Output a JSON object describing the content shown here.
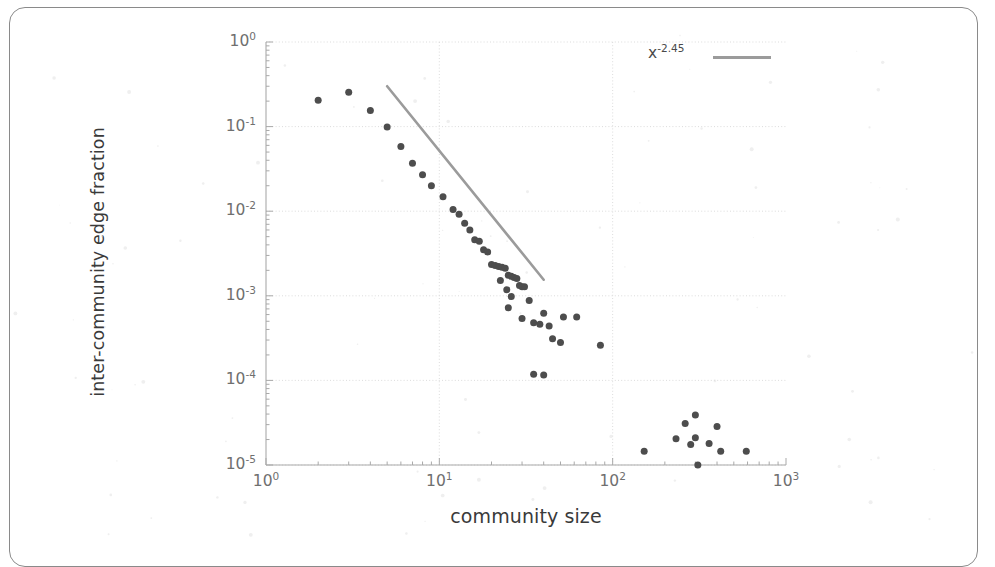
{
  "figure": {
    "kind": "scatter-plot-scanned-page",
    "background_color": "#ffffff",
    "frame_color": "#8a8a8a"
  },
  "axis_labels": {
    "x_title": "community size",
    "y_title": "inter-community edge fraction"
  },
  "ticks": {
    "x": [
      {
        "label_mantissa": "10",
        "label_exponent": "0",
        "value": 1
      },
      {
        "label_mantissa": "10",
        "label_exponent": "1",
        "value": 10
      },
      {
        "label_mantissa": "10",
        "label_exponent": "2",
        "value": 100
      },
      {
        "label_mantissa": "10",
        "label_exponent": "3",
        "value": 1000
      }
    ],
    "y": [
      {
        "label_mantissa": "10",
        "label_exponent": "0",
        "value": 1
      },
      {
        "label_mantissa": "10",
        "label_exponent": "-1",
        "value": 0.1
      },
      {
        "label_mantissa": "10",
        "label_exponent": "-2",
        "value": 0.01
      },
      {
        "label_mantissa": "10",
        "label_exponent": "-3",
        "value": 0.001
      },
      {
        "label_mantissa": "10",
        "label_exponent": "-4",
        "value": 0.0001
      },
      {
        "label_mantissa": "10",
        "label_exponent": "-5",
        "value": 1e-05
      }
    ]
  },
  "legend": {
    "entry_mantissa": "x",
    "entry_exponent": "-2.45",
    "swatch_color": "#9b9b9b"
  },
  "chart_data": {
    "type": "scatter",
    "title": "",
    "xlabel": "community size",
    "ylabel": "inter-community edge fraction",
    "xscale": "log",
    "yscale": "log",
    "xlim": [
      1,
      1000
    ],
    "ylim": [
      1e-05,
      1
    ],
    "grid": true,
    "grid_color": "#d8d8d8",
    "marker_color": "#4d4d4d",
    "marker_size_px": 7,
    "legend_position": "top-right",
    "series": [
      {
        "name": "inter-community edge fraction",
        "type": "scatter",
        "points": [
          [
            2.0,
            0.205
          ],
          [
            3.0,
            0.255
          ],
          [
            4.0,
            0.155
          ],
          [
            5.0,
            0.099
          ],
          [
            6.0,
            0.058
          ],
          [
            7.0,
            0.037
          ],
          [
            8.0,
            0.027
          ],
          [
            9.0,
            0.02
          ],
          [
            10.5,
            0.0148
          ],
          [
            12.0,
            0.0105
          ],
          [
            13.0,
            0.0092
          ],
          [
            14.0,
            0.0072
          ],
          [
            15.0,
            0.006
          ],
          [
            16.0,
            0.0046
          ],
          [
            17.0,
            0.0044
          ],
          [
            18.0,
            0.0035
          ],
          [
            19.0,
            0.0033
          ],
          [
            20.0,
            0.00235
          ],
          [
            21.0,
            0.00228
          ],
          [
            22.0,
            0.00222
          ],
          [
            23.0,
            0.00218
          ],
          [
            24.0,
            0.00212
          ],
          [
            25.0,
            0.00175
          ],
          [
            26.0,
            0.0017
          ],
          [
            27.0,
            0.00165
          ],
          [
            28.0,
            0.0016
          ],
          [
            29.0,
            0.00132
          ],
          [
            30.0,
            0.00128
          ],
          [
            22.5,
            0.00152
          ],
          [
            24.5,
            0.00118
          ],
          [
            26.0,
            0.00098
          ],
          [
            31.0,
            0.00128
          ],
          [
            33.0,
            0.00088
          ],
          [
            25.0,
            0.00072
          ],
          [
            30.0,
            0.00054
          ],
          [
            35.0,
            0.00048
          ],
          [
            38.0,
            0.00046
          ],
          [
            43.0,
            0.00044
          ],
          [
            40.0,
            0.00062
          ],
          [
            52.0,
            0.00056
          ],
          [
            45.0,
            0.00031
          ],
          [
            50.0,
            0.00028
          ],
          [
            62.0,
            0.00056
          ],
          [
            85.0,
            0.00026
          ],
          [
            35.0,
            0.000118
          ],
          [
            40.0,
            0.000116
          ]
        ]
      },
      {
        "name": "low-fraction outlier cluster",
        "type": "scatter",
        "points": [
          [
            152.0,
            1.45e-05
          ],
          [
            232.0,
            2.05e-05
          ],
          [
            262.0,
            3.1e-05
          ],
          [
            300.0,
            3.9e-05
          ],
          [
            282.0,
            1.75e-05
          ],
          [
            300.0,
            2.1e-05
          ],
          [
            310.0,
            1e-05
          ],
          [
            360.0,
            1.8e-05
          ],
          [
            400.0,
            2.85e-05
          ],
          [
            420.0,
            1.45e-05
          ],
          [
            590.0,
            1.45e-05
          ]
        ]
      },
      {
        "name": "x^-2.45 power-law fit",
        "type": "line",
        "color": "#9b9b9b",
        "exponent": -2.45,
        "endpoints": [
          [
            5.0,
            0.3
          ],
          [
            40.0,
            0.00155
          ]
        ]
      }
    ]
  }
}
